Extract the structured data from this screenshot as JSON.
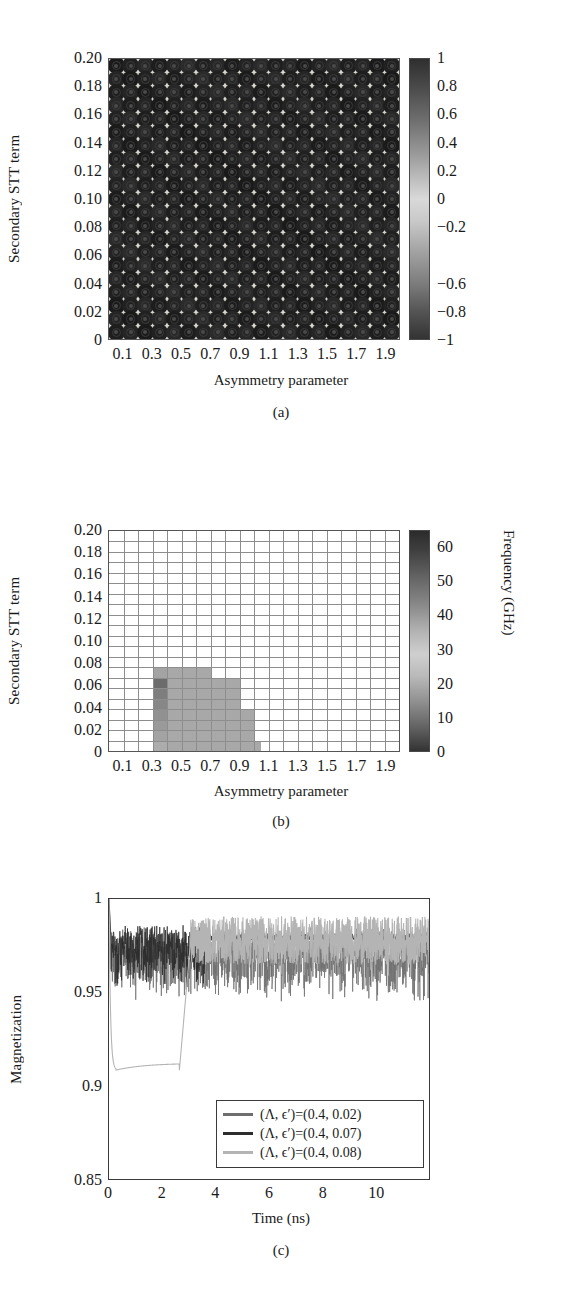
{
  "panel_a": {
    "caption": "(a)",
    "ylabel": "Secondary STT term",
    "xlabel": "Asymmetry parameter",
    "yticks": [
      "0.20",
      "0.18",
      "0.16",
      "0.14",
      "0.12",
      "0.10",
      "0.08",
      "0.06",
      "0.04",
      "0.02",
      "0"
    ],
    "xticks": [
      "0.1",
      "0.3",
      "0.5",
      "0.7",
      "0.9",
      "1.1",
      "1.3",
      "1.5",
      "1.7",
      "1.9"
    ],
    "colorbar_ticks": [
      "1",
      "0.8",
      "0.6",
      "0.4",
      "0.2",
      "0",
      "−0.2",
      "−0.6",
      "−0.8",
      "−1"
    ]
  },
  "panel_b": {
    "caption": "(b)",
    "ylabel": "Secondary STT term",
    "xlabel": "Asymmetry parameter",
    "colorbar_label": "Frequency (GHz)",
    "yticks": [
      "0.20",
      "0.18",
      "0.16",
      "0.14",
      "0.12",
      "0.10",
      "0.08",
      "0.06",
      "0.04",
      "0.02",
      "0"
    ],
    "xticks": [
      "0.1",
      "0.3",
      "0.5",
      "0.7",
      "0.9",
      "1.1",
      "1.3",
      "1.5",
      "1.7",
      "1.9"
    ],
    "colorbar_ticks": [
      "60",
      "50",
      "40",
      "30",
      "20",
      "10",
      "0"
    ]
  },
  "panel_c": {
    "caption": "(c)",
    "ylabel": "Magnetization",
    "xlabel": "Time (ns)",
    "yticks": [
      "1",
      "0.95",
      "0.9",
      "0.85"
    ],
    "xticks": [
      "0",
      "2",
      "4",
      "6",
      "8",
      "10"
    ],
    "legend": [
      {
        "label": "(Λ, ϵ′)=(0.4, 0.02)",
        "color": "#6e6e6e"
      },
      {
        "label": "(Λ, ϵ′)=(0.4, 0.07)",
        "color": "#2d2d2d"
      },
      {
        "label": "(Λ, ϵ′)=(0.4, 0.08)",
        "color": "#b4b4b4"
      }
    ]
  },
  "chart_data": [
    {
      "type": "heatmap",
      "panel": "(a)",
      "title": "",
      "xlabel": "Asymmetry parameter",
      "ylabel": "Secondary STT term",
      "xlim": [
        0.0,
        2.0
      ],
      "ylim": [
        0.0,
        0.21
      ],
      "colorbar": {
        "label": "",
        "min": -1,
        "max": 1,
        "ticks": [
          1,
          0.8,
          0.6,
          0.4,
          0.2,
          0,
          -0.2,
          -0.6,
          -0.8,
          -1
        ]
      },
      "note": "Uniformly dark field; every grid cell renders as a dark ring/disc marker, value near the extremes of the -1..1 scale across the whole parameter space.",
      "nx": 20,
      "ny": 21
    },
    {
      "type": "heatmap",
      "panel": "(b)",
      "title": "",
      "xlabel": "Asymmetry parameter",
      "ylabel": "Secondary STT term",
      "xlim": [
        0.0,
        2.0
      ],
      "ylim": [
        0.0,
        0.21
      ],
      "colorbar": {
        "label": "Frequency (GHz)",
        "min": 0,
        "max": 65,
        "ticks": [
          60,
          50,
          40,
          30,
          20,
          10,
          0
        ]
      },
      "nx": 20,
      "ny": 21,
      "grid": true,
      "background_value": null,
      "cells": [
        {
          "x0": 0.3,
          "x1": 0.4,
          "y0": 0.0,
          "y1": 0.01,
          "value": 28
        },
        {
          "x0": 0.3,
          "x1": 0.4,
          "y0": 0.01,
          "y1": 0.02,
          "value": 26
        },
        {
          "x0": 0.3,
          "x1": 0.4,
          "y0": 0.02,
          "y1": 0.03,
          "value": 24
        },
        {
          "x0": 0.3,
          "x1": 0.4,
          "y0": 0.03,
          "y1": 0.04,
          "value": 22
        },
        {
          "x0": 0.3,
          "x1": 0.4,
          "y0": 0.04,
          "y1": 0.05,
          "value": 20
        },
        {
          "x0": 0.3,
          "x1": 0.4,
          "y0": 0.05,
          "y1": 0.06,
          "value": 18
        },
        {
          "x0": 0.3,
          "x1": 0.4,
          "y0": 0.06,
          "y1": 0.07,
          "value": 14
        },
        {
          "x0": 0.3,
          "x1": 0.4,
          "y0": 0.07,
          "y1": 0.08,
          "value": 26
        },
        {
          "x0": 0.4,
          "x1": 0.5,
          "y0": 0.0,
          "y1": 0.08,
          "value": 27
        },
        {
          "x0": 0.5,
          "x1": 0.6,
          "y0": 0.0,
          "y1": 0.08,
          "value": 27
        },
        {
          "x0": 0.6,
          "x1": 0.7,
          "y0": 0.0,
          "y1": 0.08,
          "value": 27
        },
        {
          "x0": 0.7,
          "x1": 0.8,
          "y0": 0.0,
          "y1": 0.07,
          "value": 27
        },
        {
          "x0": 0.8,
          "x1": 0.9,
          "y0": 0.0,
          "y1": 0.07,
          "value": 27
        },
        {
          "x0": 0.9,
          "x1": 1.0,
          "y0": 0.0,
          "y1": 0.04,
          "value": 27
        },
        {
          "x0": 1.0,
          "x1": 1.05,
          "y0": 0.0,
          "y1": 0.01,
          "value": 27
        }
      ]
    },
    {
      "type": "line",
      "panel": "(c)",
      "title": "",
      "xlabel": "Time (ns)",
      "ylabel": "Magnetization",
      "xlim": [
        0,
        10
      ],
      "ylim": [
        0.838,
        1.0
      ],
      "xticks": [
        0,
        2,
        4,
        6,
        8,
        10
      ],
      "yticks": [
        0.85,
        0.9,
        0.95,
        1.0
      ],
      "grid": false,
      "legend_position": "lower-right-inside",
      "series": [
        {
          "name": "(Λ, ϵ′)=(0.4, 0.02)",
          "color": "#6e6e6e",
          "description": "Starts at 1, drops immediately into a noisy oscillating band centred near 0.975 with spikes down to ~0.94 for the full 0-10 ns window.",
          "mean_level": 0.975,
          "noise_amplitude": 0.035
        },
        {
          "name": "(Λ, ϵ′)=(0.4, 0.07)",
          "color": "#2d2d2d",
          "description": "Starts at 1, noisy oscillation about 0.978 until ~3 ns then settles to a nearly flat line at ~0.977.",
          "mean_level": 0.978,
          "noise_amplitude": 0.03
        },
        {
          "name": "(Λ, ϵ′)=(0.4, 0.08)",
          "color": "#b4b4b4",
          "description": "Starts at 1, falls sharply to ~0.898 by 0.2 ns, stays on a flat plateau near 0.902 until ~2.1 ns, then rises steeply to ~0.98 and continues as a light noisy band near 0.975.",
          "plateau_level": 0.901,
          "switch_time": 2.2,
          "final_level": 0.976
        }
      ]
    }
  ]
}
